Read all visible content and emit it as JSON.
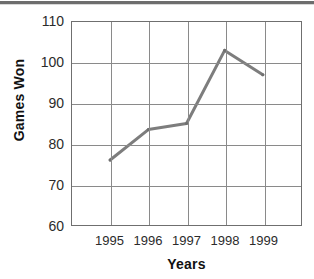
{
  "chart_data": {
    "type": "line",
    "title": "",
    "xlabel": "Years",
    "ylabel": "Games Won",
    "x": [
      1995,
      1996,
      1997,
      1998,
      1999
    ],
    "categories": [
      "1995",
      "1996",
      "1997",
      "1998",
      "1999"
    ],
    "values": [
      76,
      83.5,
      85,
      103,
      97
    ],
    "series": [
      {
        "name": "Games Won",
        "values": [
          76,
          83.5,
          85,
          103,
          97
        ],
        "color": "#7d7d7d"
      }
    ],
    "ylim": [
      60,
      110
    ],
    "yticks": [
      60,
      70,
      80,
      90,
      100,
      110
    ],
    "ytick_labels": [
      "60",
      "70",
      "80",
      "90",
      "100",
      "110"
    ],
    "xtick_labels": [
      "1995",
      "1996",
      "1997",
      "1998",
      "1999"
    ],
    "grid": true,
    "grid_color": "#8a8a8a",
    "legend": false,
    "legend_position": "none",
    "axis_color": "#6f6f6f",
    "background": "#ffffff"
  },
  "axes": {
    "y_title": "Games Won",
    "x_title": "Years"
  }
}
